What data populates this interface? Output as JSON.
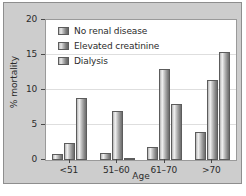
{
  "chart_data": {
    "type": "bar",
    "title": "",
    "xlabel": "Age",
    "ylabel": "% mortality",
    "categories": [
      "<51",
      "51–60",
      "61–70",
      ">70"
    ],
    "series": [
      {
        "name": "No renal disease",
        "values": [
          0.9,
          1.0,
          1.9,
          4.0
        ]
      },
      {
        "name": "Elevated creatinine",
        "values": [
          2.4,
          7.0,
          13.0,
          11.4
        ]
      },
      {
        "name": "Dialysis",
        "values": [
          8.8,
          0.1,
          8.0,
          15.4
        ]
      }
    ],
    "ylim": [
      0,
      20
    ],
    "yticks": [
      0,
      5,
      10,
      15,
      20
    ],
    "ytick_labels": [
      "0",
      "5",
      "10",
      "15",
      "20"
    ],
    "grid": true,
    "legend_position": "upper-left-inside",
    "colors": {
      "panel_background": "#cdcdcd",
      "plot_background": "#ffffff",
      "bar_light": "#f0f0f0",
      "bar_dark": "#6e6e6e",
      "bar_outline": "#5c5c5c",
      "gridline": "#dedede",
      "axis_text": "#2b2b2b"
    }
  }
}
